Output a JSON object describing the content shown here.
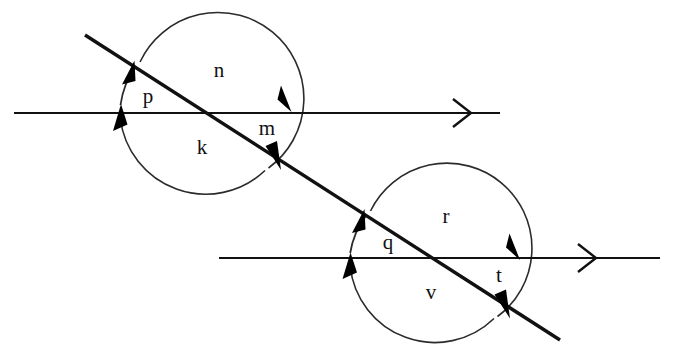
{
  "diagram": {
    "background_color": "#ffffff",
    "line_color": "#111111",
    "arc_color": "#2b2b2b",
    "label_color": "#111111",
    "canvas": {
      "width": 684,
      "height": 358
    },
    "upper_group": {
      "name": "upper-intersection",
      "circle": {
        "cx": 206,
        "cy": 110,
        "r": 86
      },
      "labels": [
        {
          "id": "p",
          "text": "p",
          "x": 148,
          "y": 98
        },
        {
          "id": "n",
          "text": "n",
          "x": 219,
          "y": 72
        },
        {
          "id": "k",
          "text": "k",
          "x": 202,
          "y": 149
        },
        {
          "id": "m",
          "text": "m",
          "x": 267,
          "y": 130
        }
      ]
    },
    "lower_group": {
      "name": "lower-intersection",
      "circle": {
        "cx": 435,
        "cy": 258,
        "r": 85
      },
      "labels": [
        {
          "id": "q",
          "text": "q",
          "x": 388,
          "y": 244
        },
        {
          "id": "r",
          "text": "r",
          "x": 446,
          "y": 218
        },
        {
          "id": "v",
          "text": "v",
          "x": 431,
          "y": 294
        },
        {
          "id": "t",
          "text": "t",
          "x": 499,
          "y": 277
        }
      ]
    },
    "lines": {
      "upper_horizontal": {
        "x1": 14,
        "y1": 113,
        "x2": 500,
        "y2": 113,
        "marker_x": 455
      },
      "lower_horizontal": {
        "x1": 219,
        "y1": 258,
        "x2": 660,
        "y2": 258,
        "marker_x": 580
      },
      "transversal": {
        "x1": 85,
        "y1": 35,
        "x2": 560,
        "y2": 340
      }
    }
  }
}
